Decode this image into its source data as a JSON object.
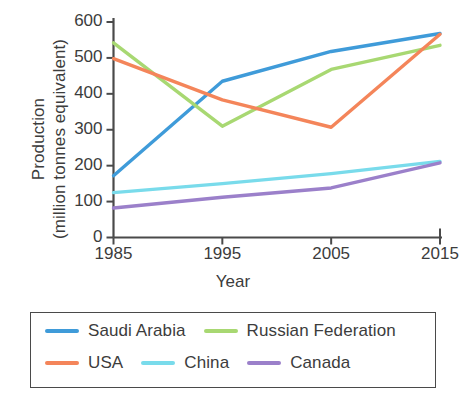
{
  "chart_data": {
    "type": "line",
    "title": "",
    "xlabel": "Year",
    "ylabel": "Production (million tonnes equivalent)",
    "ylabel_line1": "Production",
    "ylabel_line2": "(million tonnes equivalent)",
    "x": [
      1985,
      1995,
      2005,
      2015
    ],
    "xtick_labels": [
      "1985",
      "1995",
      "2005",
      "2015"
    ],
    "ytick_labels": [
      "0",
      "100",
      "200",
      "300",
      "400",
      "500",
      "600"
    ],
    "yticks": [
      0,
      100,
      200,
      300,
      400,
      500,
      600
    ],
    "xlim": [
      1985,
      2015
    ],
    "ylim": [
      0,
      600
    ],
    "grid": false,
    "legend_position": "below-plot",
    "series": [
      {
        "name": "Saudi Arabia",
        "color": "#3f9bd9",
        "values": [
          172,
          435,
          518,
          568
        ]
      },
      {
        "name": "Russian Federation",
        "color": "#a8d872",
        "values": [
          542,
          310,
          468,
          535
        ]
      },
      {
        "name": "USA",
        "color": "#f4855a",
        "values": [
          498,
          383,
          307,
          566
        ]
      },
      {
        "name": "China",
        "color": "#79dbeb",
        "values": [
          125,
          150,
          178,
          212
        ]
      },
      {
        "name": "Canada",
        "color": "#9b80ca",
        "values": [
          82,
          112,
          138,
          208
        ]
      }
    ]
  },
  "legend": {
    "rows": [
      [
        "Saudi Arabia",
        "Russian Federation"
      ],
      [
        "USA",
        "China",
        "Canada"
      ]
    ]
  },
  "axis": {
    "line_color": "#4a4a4a"
  }
}
